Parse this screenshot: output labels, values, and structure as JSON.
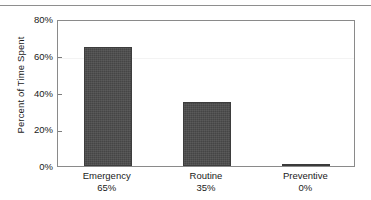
{
  "chart_data": {
    "type": "bar",
    "title": "",
    "xlabel": "",
    "ylabel": "Percent of Time Spent",
    "categories": [
      "Emergency",
      "Routine",
      "Preventive"
    ],
    "values": [
      65,
      35,
      0
    ],
    "value_labels": [
      "65%",
      "35%",
      "0%"
    ],
    "ylim": [
      0,
      80
    ],
    "ytick_values": [
      0,
      20,
      40,
      60,
      80
    ],
    "ytick_labels": [
      "0%",
      "20%",
      "40%",
      "60%",
      "80%"
    ],
    "grid": "faint-horizontal-at-60",
    "legend": "none",
    "bar_color": "#4c4c4c",
    "axis_color": "#8a8a8a",
    "frame": "full-box"
  },
  "figure": {
    "top_rule": "",
    "ylabel": "Percent of Time Spent"
  }
}
